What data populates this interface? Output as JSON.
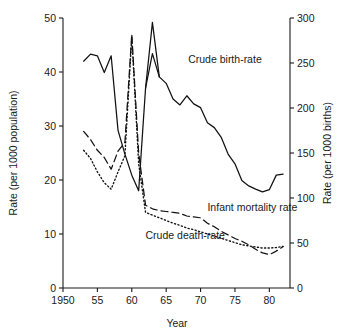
{
  "chart_data": {
    "type": "line",
    "title": "",
    "xlabel": "Year",
    "ylabel": "Rate (per 1000 population)",
    "y2label": "Rate (per 1000 births)",
    "xlim": [
      1950,
      1983
    ],
    "ylim": [
      0,
      50
    ],
    "y2lim": [
      0,
      300
    ],
    "grid": false,
    "legend_position": "inline-annotations",
    "xticks": [
      1950,
      1955,
      1960,
      1965,
      1970,
      1975,
      1980
    ],
    "xticklabels": [
      "1950",
      "55",
      "60",
      "65",
      "70",
      "75",
      "80"
    ],
    "yticks": [
      0,
      10,
      20,
      30,
      40,
      50
    ],
    "yticklabels": [
      "0",
      "10",
      "20",
      "30",
      "40",
      "50"
    ],
    "y2ticks": [
      0,
      50,
      100,
      150,
      200,
      250,
      300
    ],
    "y2ticklabels": [
      "0",
      "50",
      "100",
      "150",
      "200",
      "250",
      "300"
    ],
    "x": [
      1953,
      1954,
      1955,
      1956,
      1957,
      1958,
      1959,
      1960,
      1961,
      1962,
      1963,
      1964,
      1965,
      1966,
      1967,
      1968,
      1969,
      1970,
      1971,
      1972,
      1973,
      1974,
      1975,
      1976,
      1977,
      1978,
      1979,
      1980,
      1981,
      1982
    ],
    "series": [
      {
        "name": "Crude birth-rate",
        "axis": "left",
        "style": "solid",
        "label_x": 1968.2,
        "label_y": 41.6,
        "values": [
          42.0,
          43.3,
          43.0,
          39.9,
          43.0,
          29.2,
          24.8,
          20.9,
          18.0,
          37.0,
          43.4,
          39.1,
          37.9,
          35.0,
          33.9,
          35.6,
          34.1,
          33.4,
          30.6,
          29.7,
          27.9,
          24.8,
          23.0,
          19.9,
          18.9,
          18.3,
          17.8,
          18.2,
          20.9,
          21.1
        ],
        "peak_note": "peak 49 in 1963"
      },
      {
        "name": "Infant mortality rate",
        "axis": "right",
        "style": "dashed",
        "label_x": 1971.0,
        "label_y": 14.2,
        "values_left_scale": [
          29.0,
          27.5,
          25.5,
          24.2,
          22.0,
          25.4,
          27.0,
          47.0,
          25.0,
          15.3,
          14.7,
          14.4,
          14.2,
          14.0,
          13.8,
          13.4,
          13.2,
          13.0,
          12.0,
          11.3,
          10.5,
          9.8,
          9.2,
          8.6,
          8.0,
          7.2,
          6.5,
          6.2,
          6.9,
          7.6
        ],
        "values_per_1000_births": [
          174,
          165,
          153,
          145,
          132,
          152,
          162,
          282,
          150,
          92,
          88,
          86,
          85,
          84,
          83,
          80,
          79,
          78,
          72,
          68,
          63,
          59,
          55,
          52,
          48,
          43,
          39,
          37,
          41,
          46
        ]
      },
      {
        "name": "Crude death-rate",
        "axis": "left",
        "style": "dotted",
        "label_x": 1962.0,
        "label_y": 9.0,
        "values": [
          25.5,
          24.0,
          21.5,
          19.5,
          18.3,
          21.5,
          24.5,
          46.5,
          23.0,
          14.0,
          13.5,
          13.0,
          12.5,
          12.0,
          11.6,
          11.1,
          10.8,
          10.4,
          10.0,
          9.6,
          9.2,
          8.8,
          8.4,
          8.0,
          7.8,
          7.6,
          7.4,
          7.4,
          7.5,
          7.7
        ]
      }
    ]
  },
  "figure": {
    "left_axis_title": "Rate (per 1000 population)",
    "right_axis_title": "Rate (per 1000 births)",
    "x_axis_title": "Year",
    "annotations": [
      {
        "text": "Crude birth-rate"
      },
      {
        "text": "Infant mortality rate"
      },
      {
        "text": "Crude death-rate"
      }
    ],
    "colors": {
      "ink": "#111111",
      "background": "#ffffff"
    }
  }
}
